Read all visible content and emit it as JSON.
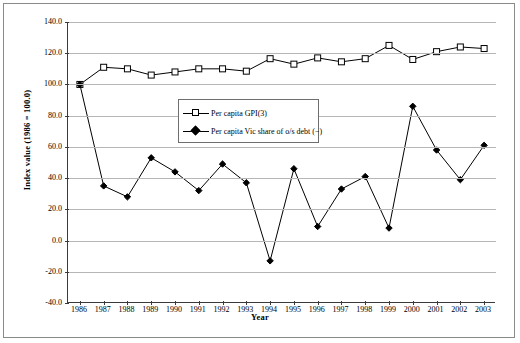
{
  "chart_data": {
    "type": "line",
    "title": "",
    "xlabel": "Year",
    "ylabel": "Index value (1986 = 100.0)",
    "categories": [
      "1986",
      "1987",
      "1988",
      "1989",
      "1990",
      "1991",
      "1992",
      "1993",
      "1994",
      "1995",
      "1996",
      "1997",
      "1998",
      "1999",
      "2000",
      "2001",
      "2002",
      "2003"
    ],
    "x": [
      1986,
      1987,
      1988,
      1989,
      1990,
      1991,
      1992,
      1993,
      1994,
      1995,
      1996,
      1997,
      1998,
      1999,
      2000,
      2001,
      2002,
      2003
    ],
    "ylim": [
      -40.0,
      140.0
    ],
    "yticks": [
      "140.0",
      "120.0",
      "100.0",
      "80.0",
      "60.0",
      "40.0",
      "20.0",
      "0.0",
      "-20.0",
      "-40.0"
    ],
    "ytick_values": [
      140.0,
      120.0,
      100.0,
      80.0,
      60.0,
      40.0,
      20.0,
      0.0,
      -20.0,
      -40.0
    ],
    "grid": true,
    "legend_position": "inside-upper-center",
    "series": [
      {
        "name": "Per capita GPI(3)",
        "marker": "open-square",
        "color": "#000000",
        "values": [
          100.0,
          111.0,
          110.0,
          106.0,
          108.0,
          110.0,
          110.0,
          108.5,
          116.5,
          113.0,
          117.0,
          114.5,
          116.5,
          125.0,
          116.0,
          121.0,
          124.0,
          123.0
        ]
      },
      {
        "name": "Per capita Vic share of o/s debt (−)",
        "marker": "filled-diamond",
        "color": "#000000",
        "values": [
          100.0,
          35.0,
          28.0,
          53.0,
          44.0,
          32.0,
          49.0,
          37.0,
          -13.0,
          46.0,
          9.0,
          33.0,
          41.0,
          8.0,
          86.0,
          58.0,
          39.0,
          61.0
        ]
      }
    ]
  }
}
